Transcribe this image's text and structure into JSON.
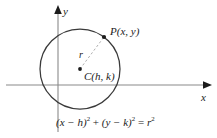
{
  "figure": {
    "axis_labels": {
      "x": "x",
      "y": "y"
    },
    "labels": {
      "radius": "r",
      "point_p": "P(x, y)",
      "center_c": "C(h, k)"
    },
    "equation": {
      "full": "(x − h)² + (y − k)² = r²",
      "lhs_term1_base": "(x − h)",
      "lhs_term1_exp": "2",
      "plus": "+",
      "lhs_term2_base": "(y − k)",
      "lhs_term2_exp": "2",
      "equals": "=",
      "rhs_base": "r",
      "rhs_exp": "2"
    },
    "colors": {
      "ink": "#1b1b1b",
      "curve": "#3a3a3a",
      "axis": "#8a8a8a",
      "axis_arrow": "#1b1b1b",
      "radius_line": "#b0b0b0",
      "background": "#ffffff"
    },
    "geometry": {
      "circle_center_px": [
        80,
        69
      ],
      "circle_radius_px": 40,
      "point_p_px": [
        104,
        37
      ],
      "x_axis_y_px": 85,
      "y_axis_x_px": 58
    }
  }
}
